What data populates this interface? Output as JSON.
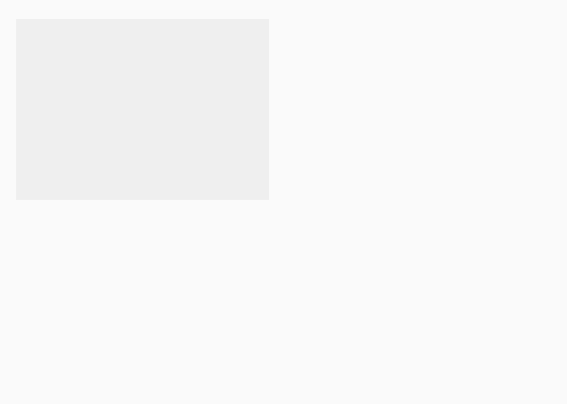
{
  "map": {
    "colors": {
      "free": "#b8b8b8",
      "slave": "#dadada",
      "open": "#dedede",
      "foreign": "#d4d4d4",
      "water": "#f4f4f4",
      "border": "#777777"
    },
    "labels": [
      {
        "id": "oregon",
        "text": "OREGON",
        "x": 92,
        "y": 70
      },
      {
        "id": "oregon2",
        "text": "TERRITORY",
        "x": 92,
        "y": 80
      },
      {
        "id": "oregon3",
        "text": "1848",
        "x": 92,
        "y": 90
      },
      {
        "id": "minn",
        "text": "MINNESOTA",
        "x": 283,
        "y": 75
      },
      {
        "id": "minn2",
        "text": "TERRITORY",
        "x": 283,
        "y": 84
      },
      {
        "id": "minn3",
        "text": "1849",
        "x": 283,
        "y": 93
      },
      {
        "id": "unorg",
        "text": "UNORGANIZED",
        "x": 221,
        "y": 133
      },
      {
        "id": "unorg2",
        "text": "TERRITORY",
        "x": 235,
        "y": 145
      },
      {
        "id": "utah",
        "text": "UTAH TERRITORY",
        "x": 130,
        "y": 157
      },
      {
        "id": "utah2",
        "text": "1850",
        "x": 130,
        "y": 167
      },
      {
        "id": "cal",
        "text": "CALIFORNIA",
        "x": 54,
        "y": 194
      },
      {
        "id": "cal2",
        "text": "1850",
        "x": 54,
        "y": 203
      },
      {
        "id": "nm",
        "text": "NEW MEXICO",
        "x": 163,
        "y": 225
      },
      {
        "id": "nm2",
        "text": "TERRITORY",
        "x": 163,
        "y": 235
      },
      {
        "id": "nm3",
        "text": "1850",
        "x": 163,
        "y": 245
      },
      {
        "id": "indian",
        "text": "INDIAN",
        "x": 279,
        "y": 224
      },
      {
        "id": "indian2",
        "text": "TERR.",
        "x": 279,
        "y": 233
      },
      {
        "id": "texas",
        "text": "TEXAS",
        "x": 262,
        "y": 277
      },
      {
        "id": "wis",
        "text": "WIS.",
        "x": 340,
        "y": 102
      },
      {
        "id": "mich",
        "text": "MICH.",
        "x": 390,
        "y": 113
      },
      {
        "id": "iowa",
        "text": "IOWA",
        "x": 305,
        "y": 138
      },
      {
        "id": "ill",
        "text": "ILL.",
        "x": 352,
        "y": 159
      },
      {
        "id": "ind",
        "text": "IND.",
        "x": 383,
        "y": 154
      },
      {
        "id": "ohio",
        "text": "OHIO",
        "x": 414,
        "y": 146
      },
      {
        "id": "pa",
        "text": "PA.",
        "x": 461,
        "y": 129
      },
      {
        "id": "ny",
        "text": "N.Y.",
        "x": 474,
        "y": 96
      },
      {
        "id": "me",
        "text": "ME.",
        "x": 521,
        "y": 51
      },
      {
        "id": "vt",
        "text": "VT.",
        "x": 490,
        "y": 72
      },
      {
        "id": "nh",
        "text": "N.H.",
        "x": 508,
        "y": 81
      },
      {
        "id": "mass",
        "text": "MASS.",
        "x": 530,
        "y": 94
      },
      {
        "id": "ri",
        "text": "R.I.",
        "x": 525,
        "y": 110
      },
      {
        "id": "conn",
        "text": "CONN.",
        "x": 524,
        "y": 120
      },
      {
        "id": "nj",
        "text": "N.J.",
        "x": 509,
        "y": 136
      },
      {
        "id": "md",
        "text": "MD.",
        "x": 472,
        "y": 148
      },
      {
        "id": "del",
        "text": "DEL.",
        "x": 508,
        "y": 150
      },
      {
        "id": "mo",
        "text": "MO.",
        "x": 321,
        "y": 182
      },
      {
        "id": "ky",
        "text": "KY.",
        "x": 400,
        "y": 187
      },
      {
        "id": "va",
        "text": "VA.",
        "x": 455,
        "y": 170
      },
      {
        "id": "nc",
        "text": "N.C.",
        "x": 460,
        "y": 200
      },
      {
        "id": "tenn",
        "text": "TENN.",
        "x": 387,
        "y": 211
      },
      {
        "id": "sc",
        "text": "S.C.",
        "x": 450,
        "y": 226
      },
      {
        "id": "ark",
        "text": "ARK.",
        "x": 326,
        "y": 230
      },
      {
        "id": "miss",
        "text": "MISS.",
        "x": 356,
        "y": 252
      },
      {
        "id": "ala",
        "text": "ALA.",
        "x": 391,
        "y": 250
      },
      {
        "id": "ga",
        "text": "GA.",
        "x": 425,
        "y": 245
      },
      {
        "id": "la",
        "text": "LA.",
        "x": 333,
        "y": 278
      },
      {
        "id": "fla",
        "text": "FLA.",
        "x": 455,
        "y": 299
      }
    ]
  },
  "legend": {
    "items": [
      {
        "label": "Free state or territory",
        "type": "free"
      },
      {
        "label": "Slave state or territory",
        "type": "slave"
      },
      {
        "label": "Territory open to slavery",
        "type": "open"
      }
    ]
  }
}
